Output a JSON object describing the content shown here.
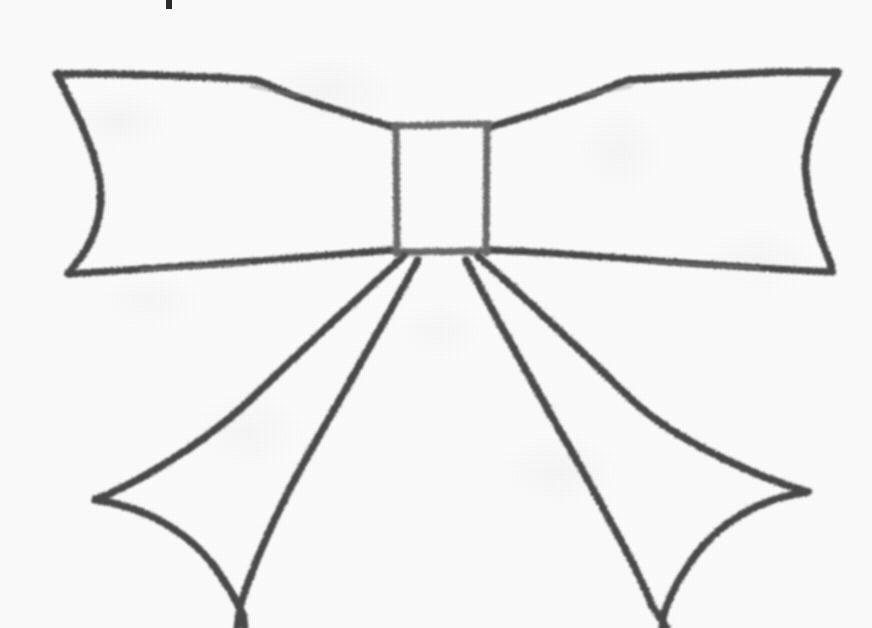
{
  "document": {
    "kind": "scanned-line-drawing",
    "subject": "ribbon bow",
    "caption_fragment": "|",
    "canvas": {
      "width": 872,
      "height": 628
    },
    "alt_text": "Black and white scanned line drawing of a ribbon bow with two upper loops, a rectangular center knot, and two tails hanging down"
  },
  "palette": {
    "paper": "#fdfdfd",
    "ink_dark": "#4a4a4a",
    "ink_mid": "#6b6b6b",
    "ink_light": "#8d8d8d",
    "text_fragment": "#2b2b2b"
  },
  "render": {
    "stroke_width_main": 7,
    "stroke_width_thin": 5,
    "blur_amount": 1.1,
    "roughness": "high"
  },
  "drawing": {
    "parts": [
      {
        "id": "center-knot",
        "label": "Center knot",
        "shape": "rectangle",
        "bounds": {
          "x": 393,
          "y": 123,
          "width": 97,
          "height": 132
        }
      },
      {
        "id": "loop-left",
        "label": "Left loop",
        "shape": "closed-path",
        "path": "M 393 126 L 318 104 L 256 80 L 57 74 C 70 110 96 150 100 188 C 103 226 80 252 68 274 L 200 266 L 300 258 L 393 250 Z"
      },
      {
        "id": "loop-right",
        "label": "Right loop",
        "shape": "closed-path",
        "path": "M 490 126 L 566 104 L 628 80 L 838 72 C 824 108 800 148 806 186 C 812 224 826 250 832 272 L 700 266 L 600 258 L 490 250 Z"
      },
      {
        "id": "tail-left",
        "label": "Left tail",
        "shape": "open-path",
        "path": "M 412 258 L 250 410 L 95 500 C 150 508 195 540 222 578 L 243 612 L 243 628"
      },
      {
        "id": "tail-right",
        "label": "Right tail",
        "shape": "open-path",
        "path": "M 472 258 L 630 408 L 808 492 C 752 500 710 534 684 574 L 664 612 L 664 628"
      },
      {
        "id": "tail-left-inner-fold",
        "label": "Left tail inner fold",
        "shape": "open-path",
        "path": "M 420 262 L 330 420 L 252 560 L 240 606 L 238 628"
      },
      {
        "id": "tail-right-inner-fold",
        "label": "Right tail inner fold",
        "shape": "open-path",
        "path": "M 466 262 L 556 418 L 652 570 L 664 610 L 666 628"
      }
    ]
  }
}
